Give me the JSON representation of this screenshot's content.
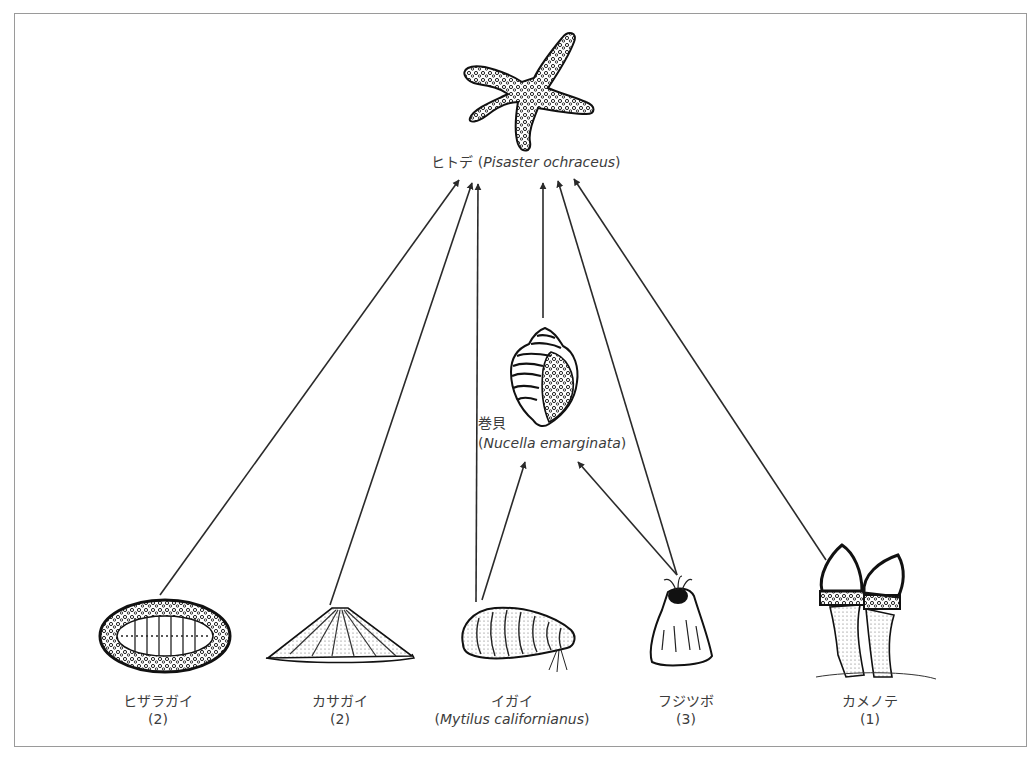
{
  "diagram": {
    "type": "food-web",
    "frame": {
      "border_color": "#9a9a9a"
    },
    "line_color": "#2a2a2a",
    "nodes": [
      {
        "id": "starfish",
        "name_ja": "ヒトデ",
        "name_sci": "Pisaster ochraceus",
        "count": null,
        "icon": "starfish-icon"
      },
      {
        "id": "whelk",
        "name_ja": "巻貝",
        "name_sci": "Nucella emarginata",
        "count": null,
        "icon": "whelk-snail-icon"
      },
      {
        "id": "chiton",
        "name_ja": "ヒザラガイ",
        "name_sci": null,
        "count": "(2)",
        "icon": "chiton-icon"
      },
      {
        "id": "limpet",
        "name_ja": "カサガイ",
        "name_sci": null,
        "count": "(2)",
        "icon": "limpet-icon"
      },
      {
        "id": "mussel",
        "name_ja": "イガイ",
        "name_sci": "Mytilus californianus",
        "count": null,
        "icon": "mussel-icon"
      },
      {
        "id": "barnacle",
        "name_ja": "フジツボ",
        "name_sci": null,
        "count": "(3)",
        "icon": "barnacle-icon"
      },
      {
        "id": "gooseneck",
        "name_ja": "カメノテ",
        "name_sci": null,
        "count": "(1)",
        "icon": "gooseneck-barnacle-icon"
      }
    ],
    "edges": [
      {
        "from": "chiton",
        "to": "starfish"
      },
      {
        "from": "limpet",
        "to": "starfish"
      },
      {
        "from": "mussel",
        "to": "starfish"
      },
      {
        "from": "mussel",
        "to": "whelk"
      },
      {
        "from": "whelk",
        "to": "starfish"
      },
      {
        "from": "barnacle",
        "to": "whelk"
      },
      {
        "from": "barnacle",
        "to": "starfish"
      },
      {
        "from": "gooseneck",
        "to": "starfish"
      }
    ]
  },
  "labels": {
    "starfish": {
      "ja": "ヒトデ",
      "open": " (",
      "sci": "Pisaster ochraceus",
      "close": ")"
    },
    "whelk": {
      "ja": "巻貝",
      "open": "(",
      "sci": "Nucella emarginata",
      "close": ")"
    },
    "chiton": {
      "ja": "ヒザラガイ",
      "count": "(2)"
    },
    "limpet": {
      "ja": "カサガイ",
      "count": "(2)"
    },
    "mussel": {
      "ja": "イガイ",
      "open": "(",
      "sci": "Mytilus californianus",
      "close": ")"
    },
    "barnacle": {
      "ja": "フジツボ",
      "count": "(3)"
    },
    "gooseneck": {
      "ja": "カメノテ",
      "count": "(1)"
    }
  }
}
